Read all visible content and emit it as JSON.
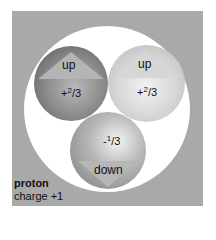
{
  "particle": {
    "name": "proton",
    "charge_label": "charge +1"
  },
  "quarks": [
    {
      "flavor": "up",
      "charge_sign": "+",
      "charge_num": "2",
      "charge_den": "3",
      "spin": "up-arrow",
      "shade": "#7a7a7a"
    },
    {
      "flavor": "up",
      "charge_sign": "+",
      "charge_num": "2",
      "charge_den": "3",
      "spin": "up-arrow",
      "shade": "#d4d4d4"
    },
    {
      "flavor": "down",
      "charge_sign": "-",
      "charge_num": "1",
      "charge_den": "3",
      "spin": "down-arrow",
      "shade": "#a0a0a0"
    }
  ],
  "colors": {
    "frame": "#a9a9a9",
    "ring": "#ffffff",
    "text": "#111111"
  }
}
